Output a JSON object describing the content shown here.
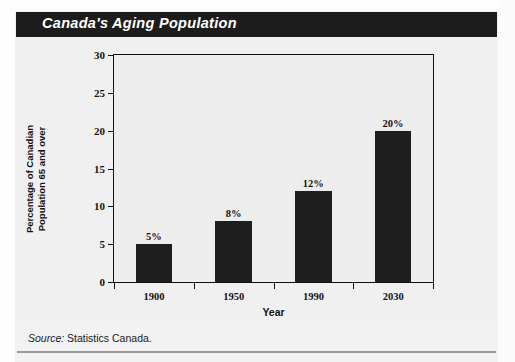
{
  "header": {
    "title": "Canada's Aging Population",
    "bar_color": "#1c1c1c",
    "text_color": "#ffffff"
  },
  "footer": {
    "source_label": "Source:",
    "source_value": "Statistics Canada."
  },
  "chart_data": {
    "type": "bar",
    "title": "Canada's Aging Population",
    "categories": [
      "1900",
      "1950",
      "1990",
      "2030"
    ],
    "values": [
      5,
      8,
      12,
      20
    ],
    "data_labels": [
      "5%",
      "8%",
      "12%",
      "20%"
    ],
    "xlabel": "Year",
    "ylabel": "Percentage of Canadian Population 65 and over",
    "ylabel_line1": "Percentage of Canadian",
    "ylabel_line2": "Population 65 and over",
    "ylim": [
      0,
      30
    ],
    "ytick_values": [
      0,
      5,
      10,
      15,
      20,
      25,
      30
    ],
    "ytick_labels": [
      "0",
      "5",
      "10",
      "15",
      "20",
      "25",
      "30"
    ],
    "grid": false,
    "legend": false,
    "bar_color": "#1e1e1e",
    "plot_background": "#ededed",
    "axis_color": "#111111"
  }
}
